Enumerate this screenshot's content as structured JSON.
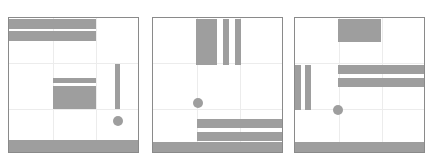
{
  "diagram": {
    "colors": {
      "fill": "#9e9e9e",
      "border": "#8a8a8a",
      "grid": "#ececec",
      "background": "#ffffff"
    },
    "panels": [
      {
        "name": "panel-1",
        "box": {
          "x": 8,
          "y": 17,
          "w": 131,
          "h": 136
        },
        "rects": [
          {
            "x": 0,
            "y": 1,
            "w": 87,
            "h": 10
          },
          {
            "x": 0,
            "y": 13,
            "w": 87,
            "h": 10
          },
          {
            "x": 44,
            "y": 60,
            "w": 43,
            "h": 5
          },
          {
            "x": 44,
            "y": 68,
            "w": 43,
            "h": 23
          },
          {
            "x": 106,
            "y": 46,
            "w": 5,
            "h": 45
          }
        ],
        "circle": {
          "cx": 109,
          "cy": 103,
          "r": 5
        },
        "floor_h": 12
      },
      {
        "name": "panel-2",
        "box": {
          "x": 152,
          "y": 17,
          "w": 131,
          "h": 136
        },
        "rects": [
          {
            "x": 43,
            "y": 1,
            "w": 21,
            "h": 46
          },
          {
            "x": 70,
            "y": 1,
            "w": 6,
            "h": 46
          },
          {
            "x": 82,
            "y": 1,
            "w": 6,
            "h": 46
          },
          {
            "x": 44,
            "y": 101,
            "w": 87,
            "h": 9
          },
          {
            "x": 44,
            "y": 114,
            "w": 87,
            "h": 9
          }
        ],
        "circle": {
          "cx": 45,
          "cy": 85,
          "r": 5
        },
        "floor_h": 10
      },
      {
        "name": "panel-3",
        "box": {
          "x": 294,
          "y": 17,
          "w": 131,
          "h": 136
        },
        "rects": [
          {
            "x": 43,
            "y": 1,
            "w": 43,
            "h": 23
          },
          {
            "x": 0,
            "y": 47,
            "w": 6,
            "h": 45
          },
          {
            "x": 10,
            "y": 47,
            "w": 6,
            "h": 45
          },
          {
            "x": 43,
            "y": 47,
            "w": 88,
            "h": 9
          },
          {
            "x": 43,
            "y": 60,
            "w": 88,
            "h": 9
          }
        ],
        "circle": {
          "cx": 43,
          "cy": 92,
          "r": 5
        },
        "floor_h": 10
      }
    ]
  }
}
